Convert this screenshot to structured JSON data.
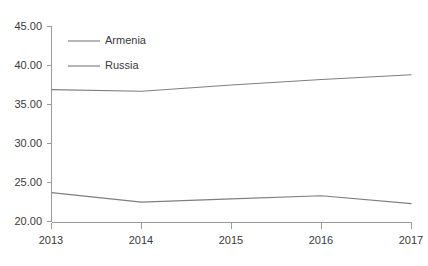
{
  "chart_data": {
    "type": "line",
    "title": "",
    "subtitle": "",
    "xlabel": "",
    "ylabel": "",
    "categories": [
      "2013",
      "2014",
      "2015",
      "2016",
      "2017"
    ],
    "x": [
      2013,
      2014,
      2015,
      2016,
      2017
    ],
    "series": [
      {
        "name": "Armenia",
        "values": [
          23.8,
          22.6,
          23.0,
          23.4,
          22.4
        ],
        "color": "#7f7f7f"
      },
      {
        "name": "Russia",
        "values": [
          36.9,
          36.7,
          37.5,
          38.2,
          38.8
        ],
        "color": "#7f7f7f"
      }
    ],
    "ylim": [
      20.0,
      45.0
    ],
    "yticks": [
      20.0,
      25.0,
      30.0,
      35.0,
      40.0,
      45.0
    ],
    "ytick_labels": [
      "20.00",
      "25.00",
      "30.00",
      "35.00",
      "40.00",
      "45.00"
    ],
    "xtick_labels": [
      "2013",
      "2014",
      "2015",
      "2016",
      "2017"
    ],
    "grid": false,
    "legend_position": "upper-left-inside",
    "legend_entries": [
      "Armenia",
      "Russia"
    ],
    "annotations": [],
    "axis_color": "#9a9a9a",
    "text_color": "#3a3a3a",
    "background": "#ffffff"
  }
}
